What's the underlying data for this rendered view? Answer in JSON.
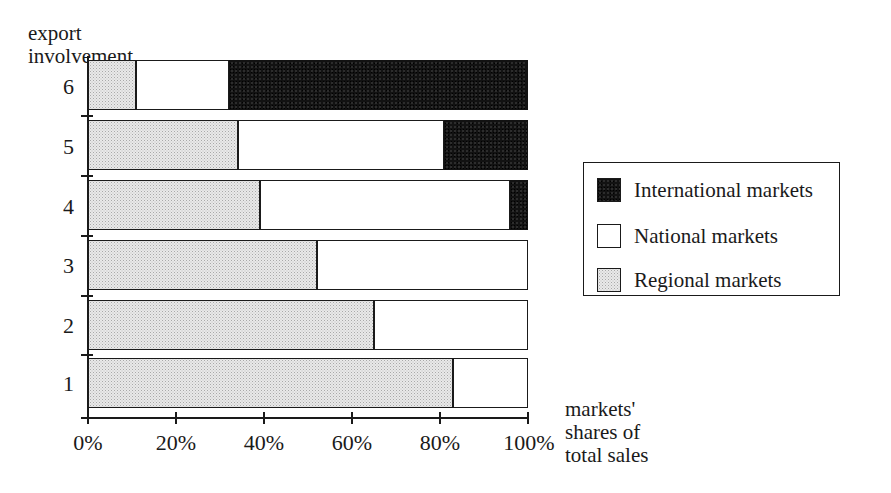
{
  "chart_data": {
    "type": "bar",
    "orientation": "horizontal",
    "stacked": true,
    "stack_total": 100,
    "title": "",
    "xlabel": "markets' shares of total sales",
    "ylabel": "export involvement",
    "xlim": [
      0,
      100
    ],
    "grid": false,
    "legend_position": "right",
    "categories": [
      "1",
      "2",
      "3",
      "4",
      "5",
      "6"
    ],
    "x_tick_labels": [
      "0%",
      "20%",
      "40%",
      "60%",
      "80%",
      "100%"
    ],
    "x_tick_values": [
      0,
      20,
      40,
      60,
      80,
      100
    ],
    "series": [
      {
        "name": "Regional markets",
        "color": "#e0e0e0",
        "values": [
          83,
          65,
          52,
          39,
          34,
          11
        ]
      },
      {
        "name": "National markets",
        "color": "#ffffff",
        "values": [
          17,
          35,
          48,
          57,
          47,
          21
        ]
      },
      {
        "name": "International markets",
        "color": "#121212",
        "values": [
          0,
          0,
          0,
          4,
          19,
          68
        ]
      }
    ]
  },
  "y_axis": {
    "title_line1": "export",
    "title_line2": "involvement",
    "ticks": [
      "6",
      "5",
      "4",
      "3",
      "2",
      "1"
    ]
  },
  "x_axis": {
    "ticks": [
      "0%",
      "20%",
      "40%",
      "60%",
      "80%",
      "100%"
    ],
    "caption_line1": "markets'",
    "caption_line2": "shares of",
    "caption_line3": "total sales"
  },
  "legend": {
    "items": [
      {
        "label": "International markets",
        "swatch": "black-filled-swatch"
      },
      {
        "label": "National markets",
        "swatch": "white-empty-swatch"
      },
      {
        "label": "Regional markets",
        "swatch": "gray-stippled-swatch"
      }
    ]
  }
}
